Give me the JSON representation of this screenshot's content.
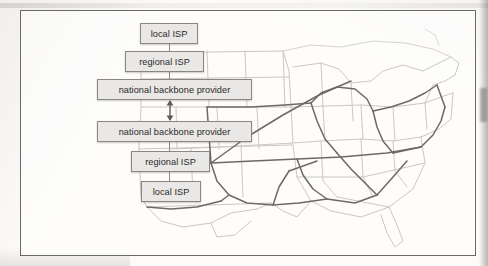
{
  "figure": {
    "kind": "network-hierarchy-diagram-over-us-map",
    "frame_border_color": "#6d6a66",
    "page_color": "#fcfbf9"
  },
  "diagram": {
    "node_fill": "#e9e8e6",
    "node_border": "#8a8783",
    "connector_color": "#8e8b87",
    "nodes": [
      {
        "id": "local-isp-top",
        "label": "local ISP",
        "x": 119,
        "y": 12,
        "w": 58,
        "h": 21
      },
      {
        "id": "regional-isp-top",
        "label": "regional ISP",
        "x": 104,
        "y": 40,
        "w": 79,
        "h": 21
      },
      {
        "id": "backbone-top",
        "label": "national backbone provider",
        "x": 76,
        "y": 68,
        "w": 155,
        "h": 21
      },
      {
        "id": "backbone-bottom",
        "label": "national backbone provider",
        "x": 76,
        "y": 110,
        "w": 155,
        "h": 21
      },
      {
        "id": "regional-isp-bottom",
        "label": "regional ISP",
        "x": 110,
        "y": 140,
        "w": 79,
        "h": 21
      },
      {
        "id": "local-isp-bottom",
        "label": "local ISP",
        "x": 120,
        "y": 170,
        "w": 60,
        "h": 21
      }
    ],
    "connectors": [
      {
        "id": "link-local-regional-top",
        "x": 148,
        "y": 33,
        "h": 7
      },
      {
        "id": "link-regional-backbone-top",
        "x": 148,
        "y": 61,
        "h": 7
      },
      {
        "id": "link-backbone-regional-bot",
        "x": 148,
        "y": 131,
        "h": 9
      },
      {
        "id": "link-regional-local-bot",
        "x": 148,
        "y": 161,
        "h": 9
      }
    ],
    "peer_arrow": {
      "id": "peering-arrow",
      "description": "double-headed vertical arrow between the two national backbone providers",
      "x": 148,
      "y_top": 89,
      "y_bottom": 110
    }
  },
  "map": {
    "description": "outline map of the eastern and central United States with state boundaries",
    "state_outline_color": "#c9c8c5",
    "backbone_link_color": "#6b6a67",
    "coastline_color": "#bdbcb9"
  }
}
